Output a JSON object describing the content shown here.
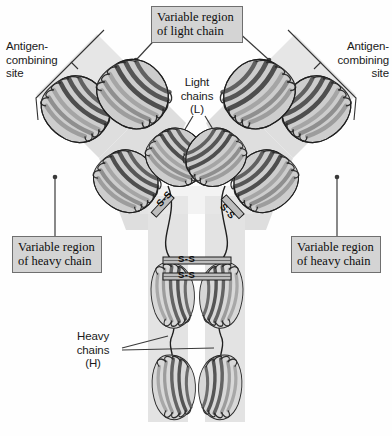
{
  "colors": {
    "background": "#fefefe",
    "band_light": "#e9e9e9",
    "band_mid": "#dcdcdc",
    "band_dark": "#cfcfcf",
    "ribbon_dark": "#4a4a4a",
    "ribbon_light": "#b9b9b9",
    "outline": "#1d1d1d",
    "box_fill": "#d4d4d4",
    "box_border": "#6f6f6f",
    "leader": "#3a3a3a",
    "text": "#111111"
  },
  "labels": {
    "variable_region_light": "Variable region\nof light chain",
    "antigen_site_left": "Antigen-\ncombining\nsite",
    "antigen_site_right": "Antigen-\ncombining\nsite",
    "light_chains": "Light\nchains\n(L)",
    "variable_region_heavy_left": "Variable region\nof heavy chain",
    "variable_region_heavy_right": "Variable region\nof heavy chain",
    "heavy_chains": "Heavy\nchains\n(H)"
  },
  "disulfide_bonds": {
    "hinge_upper": "S-S",
    "hinge_lower": "S-S",
    "arm_left": "S-S",
    "arm_right": "S-S"
  },
  "structure": {
    "domains": [
      {
        "name": "VL",
        "arm": "left",
        "position": "outer-upper"
      },
      {
        "name": "VH",
        "arm": "left",
        "position": "inner-upper"
      },
      {
        "name": "CL",
        "arm": "left",
        "position": "outer-lower"
      },
      {
        "name": "CH1",
        "arm": "left",
        "position": "inner-lower"
      },
      {
        "name": "VL",
        "arm": "right",
        "position": "outer-upper"
      },
      {
        "name": "VH",
        "arm": "right",
        "position": "inner-upper"
      },
      {
        "name": "CL",
        "arm": "right",
        "position": "outer-lower"
      },
      {
        "name": "CH1",
        "arm": "right",
        "position": "inner-lower"
      },
      {
        "name": "CH2",
        "arm": "stem-left",
        "position": "upper"
      },
      {
        "name": "CH2",
        "arm": "stem-right",
        "position": "upper"
      },
      {
        "name": "CH3",
        "arm": "stem-left",
        "position": "lower"
      },
      {
        "name": "CH3",
        "arm": "stem-right",
        "position": "lower"
      }
    ],
    "chain_count": {
      "heavy": 2,
      "light": 2
    }
  }
}
